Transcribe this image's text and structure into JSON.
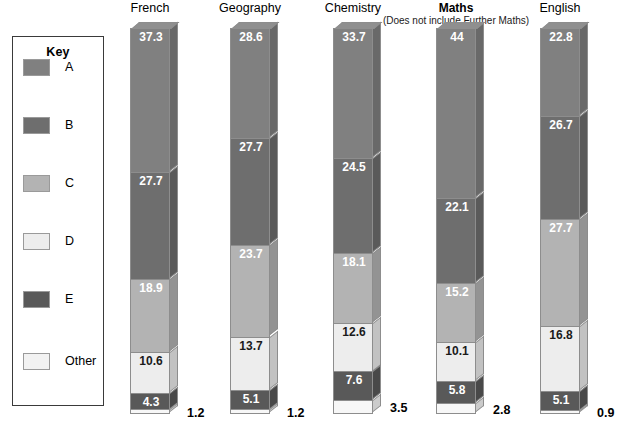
{
  "legend": {
    "title": "Key",
    "items": [
      {
        "label": "A",
        "color": "#808080",
        "name": "legend-swatch-a"
      },
      {
        "label": "B",
        "color": "#6e6e6e",
        "name": "legend-swatch-b"
      },
      {
        "label": "C",
        "color": "#b3b3b3",
        "name": "legend-swatch-c"
      },
      {
        "label": "D",
        "color": "#ededed",
        "name": "legend-swatch-d"
      },
      {
        "label": "E",
        "color": "#595959",
        "name": "legend-swatch-e"
      },
      {
        "label": "Other",
        "color": "#f2f2f2",
        "name": "legend-swatch-other"
      }
    ]
  },
  "chart_data": {
    "type": "bar",
    "subtype": "stacked-100-percent-3d",
    "title": "",
    "xlabel": "",
    "ylabel": "",
    "ylim": [
      0,
      100
    ],
    "grid": false,
    "legend_position": "left",
    "categories": [
      "French",
      "Geography",
      "Chemistry",
      "Maths",
      "English"
    ],
    "category_subtitles": [
      "",
      "",
      "",
      "(Does not include Further Maths)",
      ""
    ],
    "series": [
      {
        "name": "A",
        "color": "#808080",
        "values": [
          37.3,
          28.6,
          33.7,
          44.0,
          22.8
        ]
      },
      {
        "name": "B",
        "color": "#6e6e6e",
        "values": [
          27.7,
          27.7,
          24.5,
          22.1,
          26.7
        ]
      },
      {
        "name": "C",
        "color": "#b3b3b3",
        "values": [
          18.9,
          23.7,
          18.1,
          15.2,
          27.7
        ]
      },
      {
        "name": "D",
        "color": "#ededed",
        "values": [
          10.6,
          13.7,
          12.6,
          10.1,
          16.8
        ]
      },
      {
        "name": "E",
        "color": "#595959",
        "values": [
          4.3,
          5.1,
          7.6,
          5.8,
          5.1
        ]
      },
      {
        "name": "Other",
        "color": "#f7f7f7",
        "values": [
          1.2,
          1.2,
          3.5,
          2.8,
          0.9
        ]
      }
    ],
    "label_placement": {
      "A": "inside",
      "B": "inside",
      "C": "inside",
      "D": "inside",
      "E": "inside",
      "Other": "outside-right"
    }
  },
  "layout": {
    "bar_left_positions": [
      130,
      230,
      333,
      436,
      540
    ],
    "bar_top": 28,
    "bar_pixel_height": 386,
    "bar_width": 40
  }
}
